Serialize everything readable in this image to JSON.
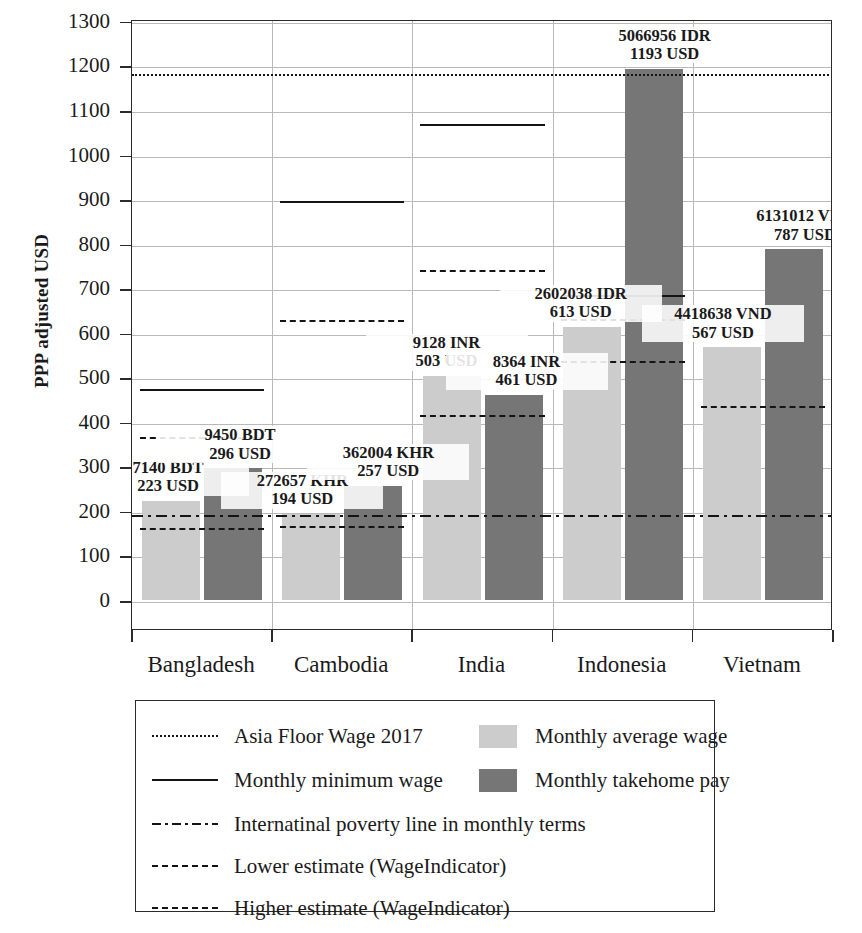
{
  "chart_data": {
    "type": "bar",
    "title": "",
    "xlabel": "",
    "ylabel": "PPP adjusted USD",
    "ylim": [
      0,
      1350
    ],
    "yticks": [
      0,
      100,
      200,
      300,
      400,
      500,
      600,
      700,
      800,
      900,
      1000,
      1100,
      1200,
      1300
    ],
    "grid": true,
    "legend_position": "below-plot",
    "categories": [
      "Bangladesh",
      "Cambodia",
      "India",
      "Indonesia",
      "Vietnam"
    ],
    "series": [
      {
        "name": "Monthly average wage",
        "color": "#cccccc",
        "values": [
          223,
          194,
          503,
          613,
          567
        ]
      },
      {
        "name": "Monthly takehome pay",
        "color": "#767676",
        "values": [
          296,
          257,
          461,
          1193,
          787
        ]
      }
    ],
    "bar_labels": [
      {
        "category": "Bangladesh",
        "series": "Monthly average wage",
        "local": "7140 BDT",
        "usd": "223 USD"
      },
      {
        "category": "Bangladesh",
        "series": "Monthly takehome pay",
        "local": "9450 BDT",
        "usd": "296 USD"
      },
      {
        "category": "Cambodia",
        "series": "Monthly average wage",
        "local": "272657 KHR",
        "usd": "194 USD"
      },
      {
        "category": "Cambodia",
        "series": "Monthly takehome pay",
        "local": "362004 KHR",
        "usd": "257 USD"
      },
      {
        "category": "India",
        "series": "Monthly average wage",
        "local": "9128 INR",
        "usd": "503 USD"
      },
      {
        "category": "India",
        "series": "Monthly takehome pay",
        "local": "8364 INR",
        "usd": "461 USD"
      },
      {
        "category": "Indonesia",
        "series": "Monthly average wage",
        "local": "2602038 IDR",
        "usd": "613 USD"
      },
      {
        "category": "Indonesia",
        "series": "Monthly takehome pay",
        "local": "5066956 IDR",
        "usd": "1193 USD"
      },
      {
        "category": "Vietnam",
        "series": "Monthly average wage",
        "local": "4418638 VND",
        "usd": "567 USD"
      },
      {
        "category": "Vietnam",
        "series": "Monthly takehome pay",
        "local": "6131012 VND",
        "usd": "787 USD"
      }
    ],
    "reference_lines": {
      "asia_floor_wage_2017": {
        "style": "dotted",
        "value": 1185,
        "spans_full_width": true
      },
      "international_poverty_line": {
        "style": "dashdot",
        "value": 196,
        "spans_full_width": true
      },
      "monthly_minimum_wage": {
        "style": "solid",
        "values": {
          "Bangladesh": 478,
          "Cambodia": 900,
          "India": 1072,
          "Indonesia": 690,
          "Vietnam": null
        }
      },
      "lower_estimate": {
        "style": "dashed",
        "values": {
          "Bangladesh": 166,
          "Cambodia": 170,
          "India": 420,
          "Indonesia": 540,
          "Vietnam": null
        }
      },
      "higher_estimate": {
        "style": "dashed",
        "values": {
          "Bangladesh": 370,
          "Cambodia": 633,
          "India": 745,
          "Indonesia": 635,
          "Vietnam": 440
        }
      }
    }
  },
  "legend": {
    "left_column": [
      {
        "label": "Asia Floor Wage 2017",
        "style": "dotted"
      },
      {
        "label": "Monthly minimum wage",
        "style": "solid"
      },
      {
        "label": "Internatinal poverty line in monthly terms",
        "style": "dashdot"
      },
      {
        "label": "Lower estimate (WageIndicator)",
        "style": "dashed"
      },
      {
        "label": "Higher estimate (WageIndicator)",
        "style": "dashed"
      }
    ],
    "right_column": [
      {
        "label": "Monthly average wage",
        "swatch": "#cccccc"
      },
      {
        "label": "Monthly takehome pay",
        "swatch": "#767676"
      }
    ]
  },
  "colors": {
    "light_bar": "#cccccc",
    "dark_bar": "#767676",
    "axis": "#2b2b2b",
    "grid": "#b9b9b9",
    "line": "#141414"
  }
}
